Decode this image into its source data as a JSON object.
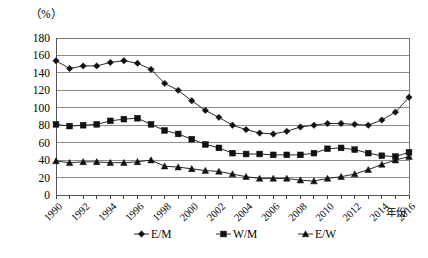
{
  "chart_data": {
    "type": "line",
    "title": "",
    "unit_label": "（%）",
    "xlabel": "年份",
    "ylabel": "",
    "ylim": [
      0,
      180
    ],
    "ytick_step": 20,
    "yticks": [
      0,
      20,
      40,
      60,
      80,
      100,
      120,
      140,
      160,
      180
    ],
    "grid": true,
    "grid_axis": "y",
    "legend_position": "bottom",
    "xlim": [
      1990,
      2016
    ],
    "x": [
      1990,
      1991,
      1992,
      1993,
      1994,
      1995,
      1996,
      1997,
      1998,
      1999,
      2000,
      2001,
      2002,
      2003,
      2004,
      2005,
      2006,
      2007,
      2008,
      2009,
      2010,
      2011,
      2012,
      2013,
      2014,
      2015,
      2016
    ],
    "xticks": [
      1990,
      1992,
      1994,
      1996,
      1998,
      2000,
      2002,
      2004,
      2006,
      2008,
      2010,
      2012,
      2014,
      2016
    ],
    "xtick_labels": [
      "1990",
      "1992",
      "1994",
      "1996",
      "1998",
      "2000",
      "2002",
      "2004",
      "2006",
      "2008",
      "2010",
      "2012",
      "2014",
      "2016"
    ],
    "series": [
      {
        "name": "E/M",
        "marker": "diamond",
        "color": "#111111",
        "values": [
          154,
          145,
          148,
          148,
          152,
          154,
          151,
          144,
          128,
          120,
          108,
          97,
          89,
          80,
          75,
          71,
          70,
          73,
          78,
          80,
          82,
          82,
          81,
          80,
          86,
          95,
          112
        ]
      },
      {
        "name": "W/M",
        "marker": "square",
        "color": "#111111",
        "values": [
          81,
          79,
          80,
          81,
          85,
          87,
          88,
          81,
          74,
          70,
          64,
          58,
          54,
          48,
          47,
          47,
          46,
          46,
          46,
          48,
          53,
          54,
          52,
          48,
          45,
          44,
          49
        ]
      },
      {
        "name": "E/W",
        "marker": "triangle",
        "color": "#111111",
        "values": [
          39,
          37,
          38,
          38,
          37,
          37,
          38,
          40,
          33,
          32,
          30,
          28,
          27,
          24,
          21,
          19,
          19,
          19,
          17,
          16,
          19,
          21,
          24,
          29,
          35,
          40,
          44
        ]
      }
    ]
  },
  "legend": {
    "items": [
      {
        "label": "E/M",
        "marker": "diamond"
      },
      {
        "label": "W/M",
        "marker": "square"
      },
      {
        "label": "E/W",
        "marker": "triangle"
      }
    ]
  }
}
